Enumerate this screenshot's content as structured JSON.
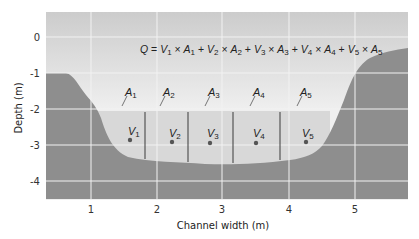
{
  "diagram": {
    "title_equation": {
      "lhs": "Q",
      "terms": [
        {
          "v": "V",
          "v_sub": "1",
          "a": "A",
          "a_sub": "1"
        },
        {
          "v": "V",
          "v_sub": "2",
          "a": "A",
          "a_sub": "2"
        },
        {
          "v": "V",
          "v_sub": "3",
          "a": "A",
          "a_sub": "3"
        },
        {
          "v": "V",
          "v_sub": "4",
          "a": "A",
          "a_sub": "4"
        },
        {
          "v": "V",
          "v_sub": "5",
          "a": "A",
          "a_sub": "5"
        }
      ]
    },
    "y_axis": {
      "label": "Depth (m)",
      "ticks": [
        "0",
        "-1",
        "-2",
        "-3",
        "-4"
      ]
    },
    "x_axis": {
      "label": "Channel width (m)",
      "ticks": [
        "1",
        "2",
        "3",
        "4",
        "5"
      ]
    },
    "segments": [
      {
        "area": "A",
        "area_sub": "1",
        "vel": "V",
        "vel_sub": "1"
      },
      {
        "area": "A",
        "area_sub": "2",
        "vel": "V",
        "vel_sub": "2"
      },
      {
        "area": "A",
        "area_sub": "3",
        "vel": "V",
        "vel_sub": "3"
      },
      {
        "area": "A",
        "area_sub": "4",
        "vel": "V",
        "vel_sub": "4"
      },
      {
        "area": "A",
        "area_sub": "5",
        "vel": "V",
        "vel_sub": "5"
      }
    ],
    "colors": {
      "sky_top": "#cfcfcf",
      "sky_bottom": "#eeeeee",
      "water": "#d6d6d6",
      "bed": "#8c8c8c",
      "grid": "#f4f4f4",
      "divider": "#555555",
      "dot": "#555555"
    }
  }
}
